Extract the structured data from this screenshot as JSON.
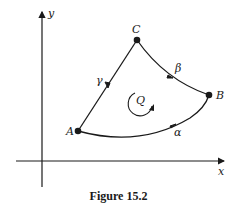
{
  "figure": {
    "caption": "Figure 15.2",
    "axes": {
      "x_label": "x",
      "y_label": "y"
    },
    "points": [
      {
        "name": "A",
        "label": "A"
      },
      {
        "name": "B",
        "label": "B"
      },
      {
        "name": "C",
        "label": "C"
      }
    ],
    "curves": [
      {
        "name": "alpha",
        "label": "α",
        "from": "A",
        "to": "B"
      },
      {
        "name": "beta",
        "label": "β",
        "from": "B",
        "to": "C"
      },
      {
        "name": "gamma",
        "label": "γ",
        "from": "C",
        "to": "A"
      }
    ],
    "region": {
      "label": "Q",
      "orientation": "counterclockwise"
    },
    "colors": {
      "ink": "#1a1a1a",
      "background": "#ffffff"
    }
  }
}
